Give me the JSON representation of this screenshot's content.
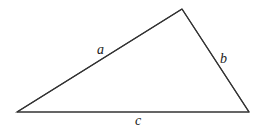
{
  "diagram": {
    "type": "triangle",
    "vertices": {
      "top": [
        182,
        9
      ],
      "left": [
        17,
        112
      ],
      "right": [
        249,
        112
      ]
    },
    "sides": [
      {
        "name": "a",
        "label": "a",
        "from": "left",
        "to": "top",
        "label_pos": [
          99,
          53
        ]
      },
      {
        "name": "b",
        "label": "b",
        "from": "top",
        "to": "right",
        "label_pos": [
          222,
          62
        ]
      },
      {
        "name": "c",
        "label": "c",
        "from": "left",
        "to": "right",
        "label_pos": [
          137,
          124
        ]
      }
    ],
    "colors": {
      "stroke": "#333333",
      "label": "#222222",
      "background": "#ffffff"
    }
  }
}
